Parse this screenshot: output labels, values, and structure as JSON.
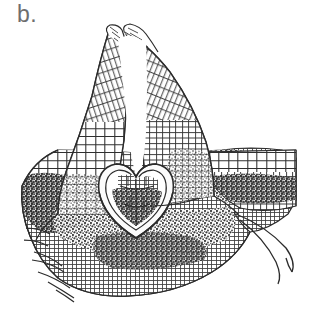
{
  "figure": {
    "panel_label": "b.",
    "label_color": "#6e6e6e",
    "background_color": "#ffffff",
    "ink_color": "#2b2b2b",
    "dense_tissue_color": "#4a4a4a",
    "style": "grayscale ink line drawing, histological cell outlines",
    "width_px": 310,
    "height_px": 309
  },
  "structures": [
    {
      "name": "left-horn-lobe",
      "description": "tall tapering lobe of elongated cells rising to upper-left tip",
      "tip_xy": [
        108,
        34
      ],
      "base_xy": [
        70,
        175
      ]
    },
    {
      "name": "right-horn-lobe",
      "description": "tall tapering lobe of elongated cells rising to upper-right tip",
      "tip_xy": [
        124,
        31
      ],
      "base_xy": [
        200,
        190
      ]
    },
    {
      "name": "central-cleft",
      "description": "white unfilled gap between the two horn lobes",
      "top_xy": [
        118,
        40
      ],
      "bottom_xy": [
        140,
        175
      ]
    },
    {
      "name": "heart-shaped-embryo",
      "description": "heart / shield shaped embryo with pale rim and dark interior detail",
      "center_xy": [
        136,
        196
      ],
      "width_px": 62,
      "height_px": 62
    },
    {
      "name": "dark-stippled-band-left",
      "description": "dense dark stippled cell zone on the left flank",
      "center_xy": [
        60,
        200
      ]
    },
    {
      "name": "dark-stippled-band-lower",
      "description": "broad dense dark stippled zone beneath the embryo",
      "center_xy": [
        150,
        235
      ]
    },
    {
      "name": "dark-stippled-band-right",
      "description": "dense dark stippled zones on the right flank",
      "center_xy": [
        240,
        185
      ]
    },
    {
      "name": "right-lateral-wing",
      "description": "tissue extension reaching the right edge of the frame",
      "tip_xy": [
        296,
        165
      ]
    },
    {
      "name": "right-filaments",
      "description": "two long curved hair-like filaments trailing to the lower right",
      "origin_xy": [
        238,
        215
      ],
      "count": 2
    },
    {
      "name": "basal-rhizoids",
      "description": "short pointed rhizoid projections along the lower-left margin",
      "origin_xy": [
        45,
        265
      ],
      "count": 5
    }
  ]
}
